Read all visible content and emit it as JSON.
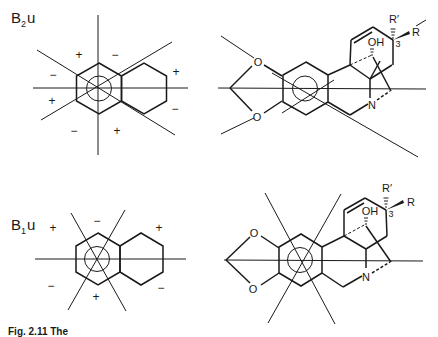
{
  "panels": [
    {
      "id": "b2u",
      "label_main": "B",
      "label_sub": "2",
      "label_tail": "u",
      "signs": [
        "+",
        "−",
        "−",
        "+",
        "+",
        "−",
        "−",
        "+"
      ],
      "molecule": {
        "atoms": [
          "O",
          "O",
          "OH",
          "N",
          "R′",
          "R",
          "3"
        ]
      }
    },
    {
      "id": "b1u",
      "label_main": "B",
      "label_sub": "1",
      "label_tail": "u",
      "signs": [
        "+",
        "−",
        "+",
        "−",
        "+",
        "−"
      ],
      "molecule": {
        "atoms": [
          "O",
          "O",
          "OH",
          "N",
          "R′",
          "R",
          "3"
        ]
      }
    }
  ],
  "caption": "Fig. 2.11  The"
}
